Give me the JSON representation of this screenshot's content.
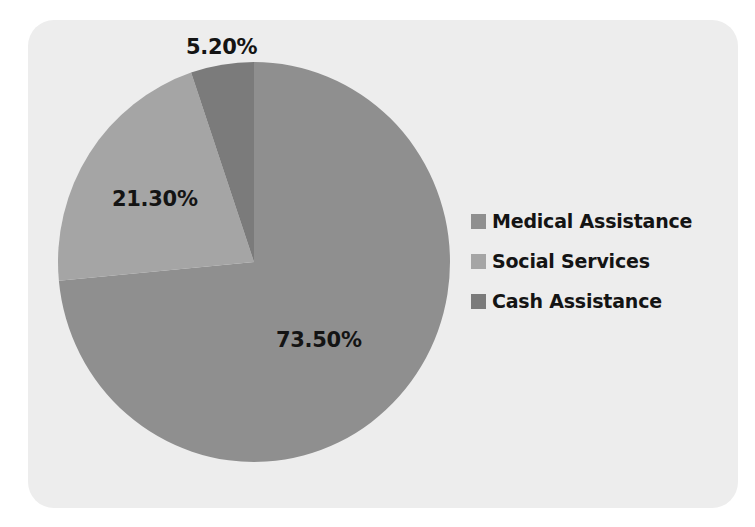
{
  "chart_data": {
    "type": "pie",
    "title": "",
    "categories": [
      "Medical Assistance",
      "Social Services",
      "Cash Assistance"
    ],
    "values": [
      73.5,
      21.3,
      5.2
    ],
    "value_labels": [
      "73.50%",
      "21.30%",
      "5.20%"
    ],
    "colors": [
      "#8f8f8f",
      "#a5a5a5",
      "#7b7b7b"
    ],
    "legend_position": "right",
    "start_angle_deg": 0,
    "direction": "clockwise"
  },
  "labels": {
    "medical": "73.50%",
    "social": "21.30%",
    "cash": "5.20%"
  },
  "legend": [
    {
      "label": "Medical Assistance",
      "color": "#8f8f8f"
    },
    {
      "label": "Social Services",
      "color": "#a5a5a5"
    },
    {
      "label": "Cash Assistance",
      "color": "#7b7b7b"
    }
  ]
}
